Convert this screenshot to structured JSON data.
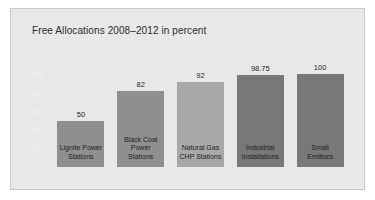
{
  "figure": {
    "background_color": "#e8e8e8",
    "border_color": "#c9c9c9",
    "page_background": "#ffffff"
  },
  "chart_data": {
    "type": "bar",
    "title": "Free Allocations 2008–2012 in percent",
    "xlabel": "",
    "ylabel": "",
    "ylim": [
      0,
      110
    ],
    "grid": false,
    "legend": "none",
    "y_ticks": [
      100,
      80,
      60,
      40,
      20,
      0
    ],
    "y_tick_labels": [
      "100",
      "80",
      "60",
      "40",
      "20",
      "0"
    ],
    "categories": [
      "Lignite Power Stations",
      "Black Coal Power Stations",
      "Natural Gas CHP Stations",
      "Industrial Installations",
      "Small Emittors"
    ],
    "values": [
      50,
      82,
      92,
      98.75,
      100
    ],
    "value_labels": [
      "50",
      "82",
      "92",
      "98.75",
      "100"
    ],
    "bar_colors": [
      "#8f8f8f",
      "#8f8f8f",
      "#a8a8a8",
      "#787878",
      "#787878"
    ],
    "bars": [
      {
        "category": "Lignite Power Stations",
        "category_lines": [
          "Lignite Power",
          "Stations"
        ],
        "value": 50,
        "value_label": "50",
        "color": "#8f8f8f"
      },
      {
        "category": "Black Coal Power Stations",
        "category_lines": [
          "Black Coal",
          "Power Stations"
        ],
        "value": 82,
        "value_label": "82",
        "color": "#8f8f8f"
      },
      {
        "category": "Natural Gas CHP Stations",
        "category_lines": [
          "Natural Gas",
          "CHP Stations"
        ],
        "value": 92,
        "value_label": "92",
        "color": "#a8a8a8"
      },
      {
        "category": "Industrial Installations",
        "category_lines": [
          "Industrial",
          "Installations"
        ],
        "value": 98.75,
        "value_label": "98.75",
        "color": "#787878"
      },
      {
        "category": "Small Emittors",
        "category_lines": [
          "Small",
          "Emittors"
        ],
        "value": 100,
        "value_label": "100",
        "color": "#787878"
      }
    ]
  }
}
